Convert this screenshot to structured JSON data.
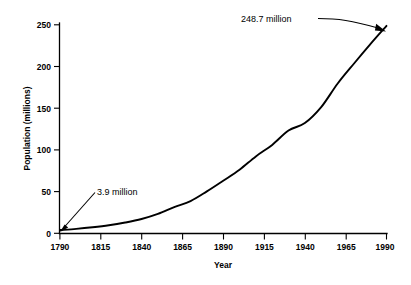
{
  "chart_data": {
    "type": "line",
    "title": "",
    "subtitle": "",
    "xlabel": "Year",
    "ylabel": "Population (millions)",
    "xlim": [
      1790,
      1990
    ],
    "ylim": [
      0,
      250
    ],
    "grid": false,
    "legend": false,
    "legend_position": "none",
    "x_ticks": [
      1790,
      1815,
      1840,
      1865,
      1890,
      1915,
      1940,
      1965,
      1990
    ],
    "x_tick_labels": [
      "1790",
      "1815",
      "1840",
      "1865",
      "1890",
      "1915",
      "1940",
      "1965",
      "1990"
    ],
    "y_ticks": [
      0,
      50,
      100,
      150,
      200,
      250
    ],
    "y_tick_labels": [
      "0",
      "50",
      "100",
      "150",
      "200",
      "250"
    ],
    "series": [
      {
        "name": "U.S. Population",
        "color": "#000000",
        "x": [
          1790,
          1800,
          1810,
          1820,
          1830,
          1840,
          1850,
          1860,
          1870,
          1880,
          1890,
          1900,
          1910,
          1920,
          1930,
          1940,
          1950,
          1960,
          1970,
          1980,
          1990
        ],
        "values": [
          3.9,
          5.3,
          7.2,
          9.6,
          12.9,
          17.1,
          23.2,
          31.4,
          38.6,
          50.2,
          63.0,
          76.2,
          92.2,
          106.0,
          123.2,
          132.2,
          151.3,
          179.3,
          203.3,
          226.5,
          248.7
        ]
      }
    ],
    "annotations": [
      {
        "name": "start-value",
        "text": "3.9 million",
        "points_to_x": 1790,
        "points_to_y": 3.9,
        "label_x": 97,
        "label_y": 192
      },
      {
        "name": "end-value",
        "text": "248.7 million",
        "points_to_x": 1990,
        "points_to_y": 248.7,
        "label_x": 241,
        "label_y": 22
      }
    ]
  },
  "axes": {
    "x_title": "Year",
    "y_title": "Population (millions)"
  },
  "colors": {
    "background": "#ffffff",
    "foreground": "#000000",
    "curve": "#000000"
  }
}
